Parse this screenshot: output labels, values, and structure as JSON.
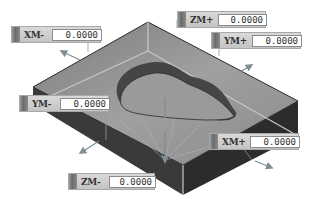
{
  "scene": {
    "object": "stock-block-with-pocket",
    "colors": {
      "top_face": "#8e8e8e",
      "left_face": "#3a3a3a",
      "right_face": "#2e2e2e",
      "pocket_wall": "#4a4a4a",
      "arrow": "#7a8a90"
    }
  },
  "offsets": {
    "xm_minus": {
      "label": "XM-",
      "value": "0.0000"
    },
    "zm_plus": {
      "label": "ZM+",
      "value": "0.0000"
    },
    "ym_plus": {
      "label": "YM+",
      "value": "0.0000"
    },
    "ym_minus": {
      "label": "YM-",
      "value": "0.0000"
    },
    "xm_plus": {
      "label": "XM+",
      "value": "0.0000"
    },
    "zm_minus": {
      "label": "ZM-",
      "value": "0.0000"
    }
  }
}
